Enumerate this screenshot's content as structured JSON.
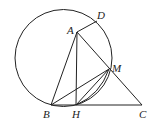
{
  "diagram": {
    "type": "geometry",
    "circle": {
      "cx": 63.5,
      "cy": 58,
      "r": 48.5
    },
    "points": {
      "A": {
        "label": "A",
        "x": 77,
        "y": 32,
        "lx": 67,
        "ly": 34
      },
      "D": {
        "label": "D",
        "x": 97,
        "y": 21,
        "lx": 97,
        "ly": 19
      },
      "M": {
        "label": "M",
        "x": 109,
        "y": 69,
        "lx": 112,
        "ly": 72
      },
      "B": {
        "label": "B",
        "x": 51,
        "y": 105,
        "lx": 43,
        "ly": 118
      },
      "H": {
        "label": "H",
        "x": 76,
        "y": 105,
        "lx": 72,
        "ly": 118
      },
      "C": {
        "label": "C",
        "x": 142,
        "y": 105,
        "lx": 139,
        "ly": 118
      }
    },
    "segments": [
      [
        "A",
        "D"
      ],
      [
        "A",
        "B"
      ],
      [
        "A",
        "H"
      ],
      [
        "A",
        "C"
      ],
      [
        "B",
        "C"
      ],
      [
        "B",
        "M"
      ],
      [
        "H",
        "M"
      ]
    ]
  }
}
